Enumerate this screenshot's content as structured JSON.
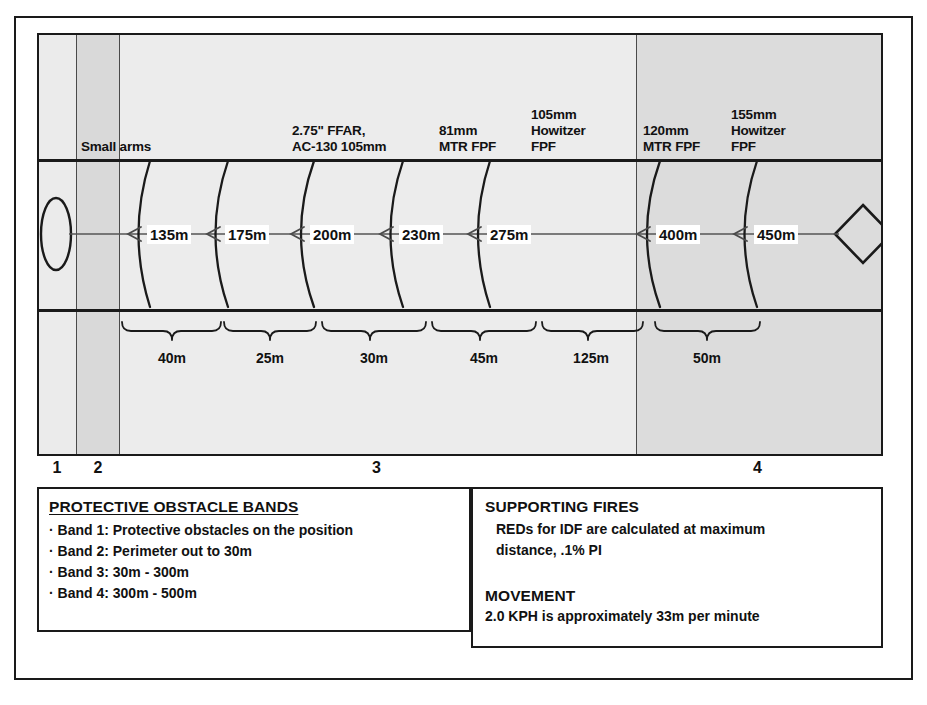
{
  "diagram": {
    "colors": {
      "band_light": "#ebebeb",
      "band_medium": "#dcdcdc",
      "band_dark": "#d2d2d2",
      "line": "#1a1a1a",
      "divider": "#4a4a4a"
    },
    "position_marker": "ellipse-position-icon",
    "enemy_marker": "diamond-enemy-icon"
  },
  "weapon_labels": [
    {
      "id": "small-arms",
      "text": "Small arms"
    },
    {
      "id": "ffar-ac130",
      "text": "2.75\" FFAR,\nAC-130 105mm"
    },
    {
      "id": "mtr-81mm",
      "text": "81mm\nMTR FPF"
    },
    {
      "id": "howitzer-105mm",
      "text": "105mm\nHowitzer\nFPF"
    },
    {
      "id": "mtr-120mm",
      "text": "120mm\nMTR FPF"
    },
    {
      "id": "howitzer-155mm",
      "text": "155mm\nHowitzer\nFPF"
    }
  ],
  "distances": [
    {
      "id": "d135",
      "label": "135m",
      "value": 135
    },
    {
      "id": "d175",
      "label": "175m",
      "value": 175
    },
    {
      "id": "d200",
      "label": "200m",
      "value": 200
    },
    {
      "id": "d230",
      "label": "230m",
      "value": 230
    },
    {
      "id": "d275",
      "label": "275m",
      "value": 275
    },
    {
      "id": "d400",
      "label": "400m",
      "value": 400
    },
    {
      "id": "d450",
      "label": "450m",
      "value": 450
    }
  ],
  "intervals": [
    {
      "id": "i40",
      "label": "40m",
      "value": 40
    },
    {
      "id": "i25",
      "label": "25m",
      "value": 25
    },
    {
      "id": "i30",
      "label": "30m",
      "value": 30
    },
    {
      "id": "i45",
      "label": "45m",
      "value": 45
    },
    {
      "id": "i125",
      "label": "125m",
      "value": 125
    },
    {
      "id": "i50",
      "label": "50m",
      "value": 50
    }
  ],
  "band_numbers": [
    {
      "id": "band-1",
      "label": "1"
    },
    {
      "id": "band-2",
      "label": "2"
    },
    {
      "id": "band-3",
      "label": "3"
    },
    {
      "id": "band-4",
      "label": "4"
    }
  ],
  "legend_left": {
    "title": "PROTECTIVE OBSTACLE BANDS",
    "items": [
      "· Band 1: Protective obstacles on the position",
      "· Band 2: Perimeter out to 30m",
      "· Band 3: 30m - 300m",
      "· Band 4: 300m - 500m"
    ]
  },
  "legend_right": {
    "section1_title": "SUPPORTING FIRES",
    "section1_lines": [
      "REDs for IDF are calculated at maximum",
      "distance, .1% PI"
    ],
    "section2_title": "MOVEMENT",
    "section2_lines": [
      "2.0 KPH is approximately 33m per minute"
    ]
  }
}
